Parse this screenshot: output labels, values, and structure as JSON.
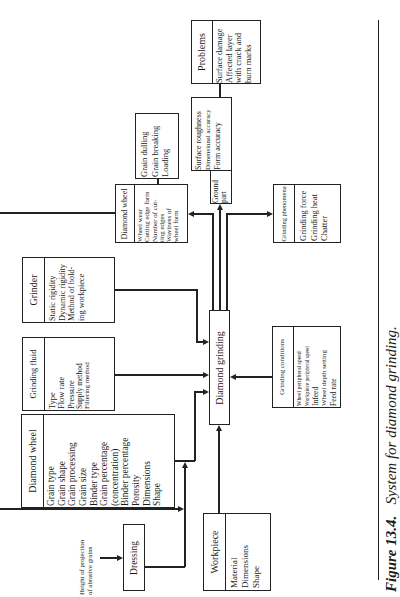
{
  "figure": {
    "label": "Figure 13.4.",
    "caption": "System for diamond grinding."
  },
  "center": {
    "title": "Diamond grinding"
  },
  "inputs": {
    "grinder": {
      "title": "Grinder",
      "items": [
        "Static rigidity",
        "Dynamic rigidity",
        "Method of hold-",
        "ing workpiece"
      ]
    },
    "grinding_fluid": {
      "title": "Grinding fluid",
      "items": [
        "Type",
        "Flow rate",
        "Pressure",
        "Supply method",
        "Filtering method"
      ]
    },
    "diamond_wheel": {
      "title": "Diamond wheel",
      "items": [
        "Grain type",
        "Grain shape",
        "Grain processing",
        "Grain size",
        "Binder type",
        "Grain percentage",
        "(concentration)",
        "Binder percentage",
        "Porosity",
        "Dimensions",
        "Shape"
      ]
    },
    "workpiece": {
      "title": "Workpiece",
      "items": [
        "Material",
        "Dimensions",
        "Shape"
      ]
    },
    "grinding_conditions": {
      "title": "Grinding conditions",
      "items": [
        "Wheel peripheral speed",
        "Workpiece peripheral speed",
        "Infeed",
        "Wheel depth setting",
        "Feed rate"
      ]
    },
    "dressing": {
      "title": "Dressing"
    },
    "projection_note": {
      "lines": [
        "Height of projection",
        "of abrasive grains"
      ]
    }
  },
  "outputs": {
    "diamond_wheel_state": {
      "title": "Diamond wheel",
      "items": [
        "Wheel wear",
        "Cutting edge form",
        "Number of cut-",
        "ting edges",
        "Waviness of",
        "wheel form"
      ]
    },
    "wheel_problems": {
      "items": [
        "Grain dulling",
        "Grain breaking",
        "Loading"
      ]
    },
    "ground_part": {
      "title": "Ground part",
      "title_lines": [
        "Ground",
        "part"
      ],
      "items": [
        "Surface roughness",
        "Dimensional accuracy",
        "Form accuracy"
      ]
    },
    "problems": {
      "title": "Problems",
      "items": [
        "Surface damage",
        "Affected layer",
        "with crack and",
        "burn marks"
      ]
    },
    "grinding_phenomena": {
      "title": "Grinding phenomena",
      "items": [
        "Grinding force",
        "Grinding heat",
        "Chatter"
      ]
    }
  }
}
